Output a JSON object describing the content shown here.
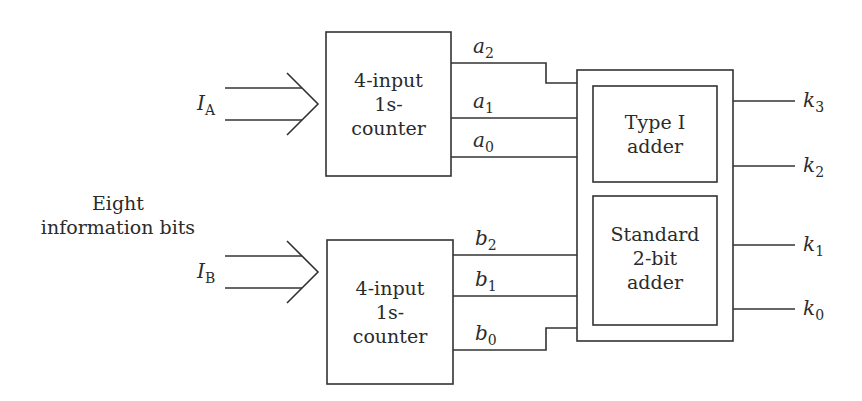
{
  "diagram": {
    "description_label": {
      "line1": "Eight",
      "line2": "information bits"
    },
    "inputs": [
      {
        "id": "IA",
        "var": "I",
        "sub": "A"
      },
      {
        "id": "IB",
        "var": "I",
        "sub": "B"
      }
    ],
    "counters": [
      {
        "id": "counter-a",
        "line1": "4-input",
        "line2": "1s-",
        "line3": "counter"
      },
      {
        "id": "counter-b",
        "line1": "4-input",
        "line2": "1s-",
        "line3": "counter"
      }
    ],
    "counter_a_outputs": [
      {
        "var": "a",
        "sub": "2"
      },
      {
        "var": "a",
        "sub": "1"
      },
      {
        "var": "a",
        "sub": "0"
      }
    ],
    "counter_b_outputs": [
      {
        "var": "b",
        "sub": "2"
      },
      {
        "var": "b",
        "sub": "1"
      },
      {
        "var": "b",
        "sub": "0"
      }
    ],
    "adders": {
      "type1": {
        "line1": "Type I",
        "line2": "adder"
      },
      "standard": {
        "line1": "Standard",
        "line2": "2-bit",
        "line3": "adder"
      }
    },
    "outputs": [
      {
        "var": "k",
        "sub": "3"
      },
      {
        "var": "k",
        "sub": "2"
      },
      {
        "var": "k",
        "sub": "1"
      },
      {
        "var": "k",
        "sub": "0"
      }
    ]
  }
}
